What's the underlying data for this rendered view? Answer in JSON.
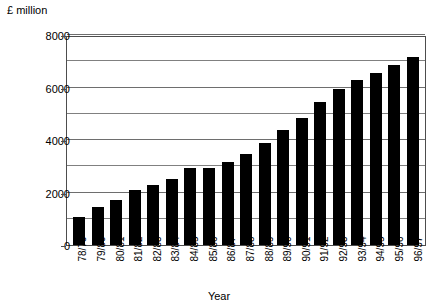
{
  "chart_data": {
    "type": "bar",
    "title": "",
    "unit_label": "£ million",
    "xlabel": "Year",
    "ylabel": "",
    "ylim": [
      0,
      8000
    ],
    "ytick_labels": [
      "0",
      "2000",
      "4000",
      "6000",
      "8000"
    ],
    "ytick_values": [
      0,
      2000,
      4000,
      6000,
      8000
    ],
    "gridline_values": [
      1000,
      2000,
      3000,
      4000,
      5000,
      6000,
      7000,
      8000
    ],
    "grid": true,
    "legend": "none",
    "bar_color": "#000000",
    "categories": [
      "78/79",
      "79/80",
      "80/81",
      "81/82",
      "82/83",
      "83/84",
      "84/85",
      "85/86",
      "86/87",
      "87/88",
      "88/89",
      "89/90",
      "90/91",
      "91/92",
      "92/93",
      "93/94",
      "94/95",
      "95/96",
      "96/97"
    ],
    "values": [
      1050,
      1450,
      1700,
      2100,
      2300,
      2500,
      2950,
      2950,
      3150,
      3450,
      3900,
      4400,
      4850,
      5450,
      5950,
      6300,
      6550,
      6850,
      7150
    ]
  }
}
